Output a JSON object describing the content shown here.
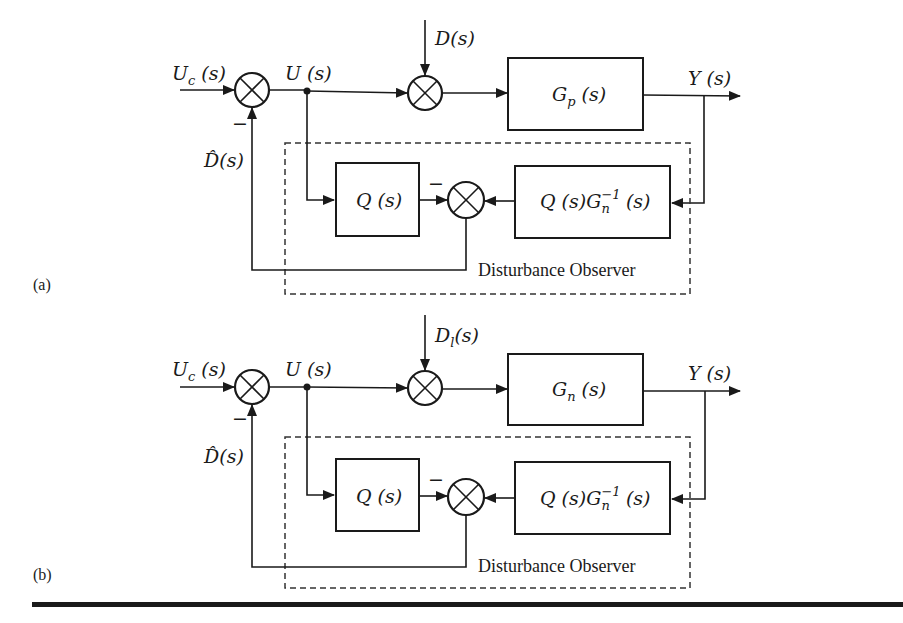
{
  "figure": {
    "panels": [
      {
        "id": "a",
        "tag": "(a)",
        "input_label": "U",
        "input_sub": "c",
        "input_arg": " (s)",
        "control_label": "U (s)",
        "disturbance_label": "D",
        "disturbance_sub": "",
        "disturbance_arg": "(s)",
        "plant_label": "G",
        "plant_sub": "p",
        "plant_arg": " (s)",
        "output_label": "Y (s)",
        "estimate_label": "D̂(s)",
        "minus_sign": "−",
        "q_block": "Q (s)",
        "inverse_block_pre": "Q (s)G",
        "inverse_block_sub": "n",
        "inverse_block_sup": "−1",
        "inverse_block_post": " (s)",
        "observer_label": "Disturbance Observer"
      },
      {
        "id": "b",
        "tag": "(b)",
        "input_label": "U",
        "input_sub": "c",
        "input_arg": " (s)",
        "control_label": "U (s)",
        "disturbance_label": "D",
        "disturbance_sub": "l",
        "disturbance_arg": "(s)",
        "plant_label": "G",
        "plant_sub": "n",
        "plant_arg": " (s)",
        "output_label": "Y (s)",
        "estimate_label": "D̂(s)",
        "minus_sign": "−",
        "q_block": "Q (s)",
        "inverse_block_pre": "Q (s)G",
        "inverse_block_sub": "n",
        "inverse_block_sup": "−1",
        "inverse_block_post": " (s)",
        "observer_label": "Disturbance Observer"
      }
    ]
  }
}
